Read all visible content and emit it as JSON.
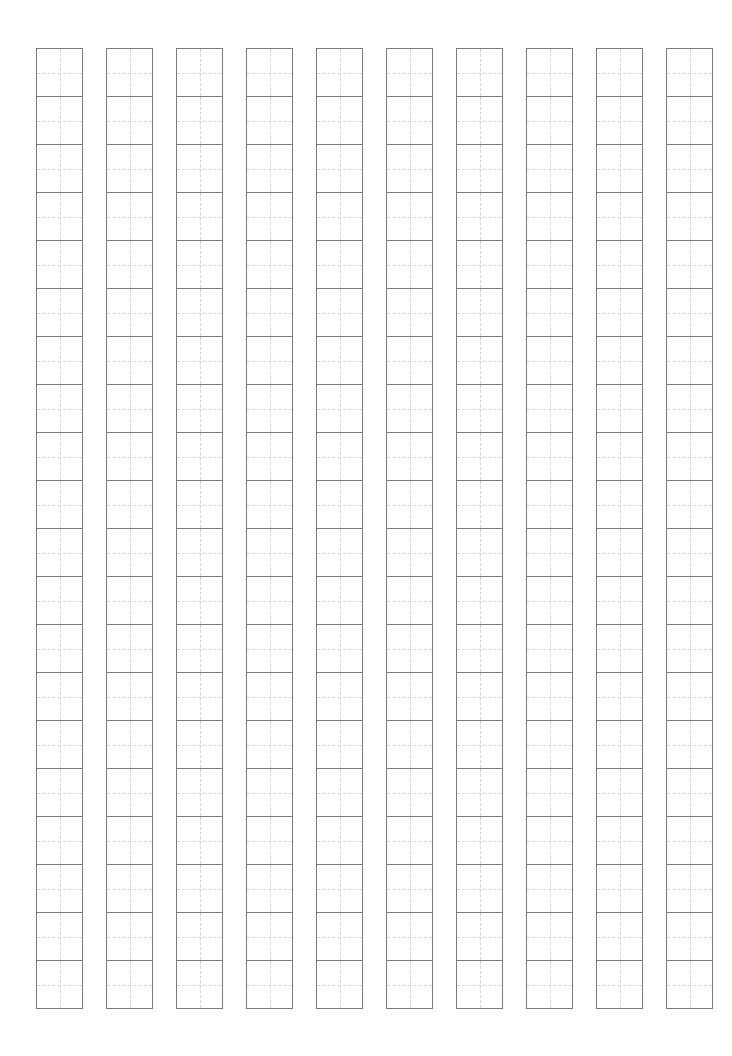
{
  "page": {
    "title": "",
    "type": "character-practice-grid",
    "grid_style": "tian-zi-ge"
  },
  "grid": {
    "columns": 10,
    "rows": 20,
    "column_width_px": 47,
    "cell_height_px": 48,
    "column_pitch_px": 70,
    "first_column_left_px": 36,
    "top_px": 48,
    "outline_color": "#7a7a7a",
    "guide_color": "#d4d4d4",
    "guide_style": "dashed"
  }
}
